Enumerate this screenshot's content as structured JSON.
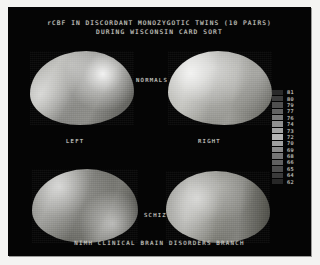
{
  "slide": {
    "title_line_1": "rCBF IN DISCORDANT MONOZYGOTIC TWINS (10 PAIRS)",
    "title_line_2": "DURING WISCONSIN CARD SORT",
    "footer": "NIMH CLINICAL BRAIN DISORDERS BRANCH",
    "background_color": "#050505",
    "border_color": "#f4f4f2",
    "text_color": "#d2d2cb"
  },
  "labels": {
    "normals": "NORMALS",
    "left": "LEFT",
    "right": "RIGHT",
    "schiz": "SCHIZ"
  },
  "scans": [
    {
      "name": "normals-left",
      "group": "NORMALS",
      "hemisphere": "LEFT"
    },
    {
      "name": "normals-right",
      "group": "NORMALS",
      "hemisphere": "RIGHT"
    },
    {
      "name": "schiz-left",
      "group": "SCHIZ",
      "hemisphere": "LEFT"
    },
    {
      "name": "schiz-right",
      "group": "SCHIZ",
      "hemisphere": "RIGHT"
    }
  ],
  "chart_data": {
    "type": "heatmap",
    "title": "rCBF IN DISCORDANT MONOZYGOTIC TWINS (10 PAIRS) DURING WISCONSIN CARD SORT",
    "subtitle": "NIMH CLINICAL BRAIN DISORDERS BRANCH",
    "xlabel": "",
    "ylabel": "",
    "colormap": "grayscale",
    "legend_position": "right",
    "legend_title": "",
    "panels": [
      {
        "row": "NORMALS",
        "col": "LEFT"
      },
      {
        "row": "NORMALS",
        "col": "RIGHT"
      },
      {
        "row": "SCHIZ",
        "col": "LEFT"
      },
      {
        "row": "SCHIZ",
        "col": "RIGHT"
      }
    ],
    "colorbar": {
      "unit": "rCBF",
      "range": [
        62,
        81
      ],
      "ticks": [
        81,
        80,
        79,
        77,
        76,
        74,
        73,
        72,
        70,
        69,
        68,
        66,
        65,
        64,
        62
      ],
      "swatches": [
        {
          "value": "81",
          "color": "#2a2a2a"
        },
        {
          "value": "80",
          "color": "#3c3c3c"
        },
        {
          "value": "79",
          "color": "#4f4f4f"
        },
        {
          "value": "77",
          "color": "#636363"
        },
        {
          "value": "76",
          "color": "#7a7a7a"
        },
        {
          "value": "74",
          "color": "#8f8f8f"
        },
        {
          "value": "73",
          "color": "#a3a3a3"
        },
        {
          "value": "72",
          "color": "#b4b4b4"
        },
        {
          "value": "70",
          "color": "#a0a0a0"
        },
        {
          "value": "69",
          "color": "#8b8b8b"
        },
        {
          "value": "68",
          "color": "#757575"
        },
        {
          "value": "66",
          "color": "#616161"
        },
        {
          "value": "65",
          "color": "#4c4c4c"
        },
        {
          "value": "64",
          "color": "#3a3a3a"
        },
        {
          "value": "62",
          "color": "#272727"
        }
      ]
    }
  }
}
